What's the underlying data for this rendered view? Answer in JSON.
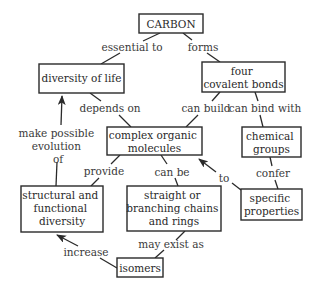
{
  "diagram": {
    "type": "concept-map",
    "colors": {
      "line": "#2a2a2a",
      "text": "#2a2a2a",
      "background": "#ffffff"
    },
    "nodes": {
      "carbon": {
        "lines": [
          "CARBON"
        ]
      },
      "diversity_of_life": {
        "lines": [
          "diversity of life"
        ]
      },
      "four_covalent_bonds": {
        "lines": [
          "four",
          "covalent bonds"
        ]
      },
      "complex_organic_molecules": {
        "lines": [
          "complex organic",
          "molecules"
        ]
      },
      "chemical_groups": {
        "lines": [
          "chemical",
          "groups"
        ]
      },
      "structural_functional_diversity": {
        "lines": [
          "structural and",
          "functional",
          "diversity"
        ]
      },
      "straight_branching_rings": {
        "lines": [
          "straight or",
          "branching chains",
          "and rings"
        ]
      },
      "specific_properties": {
        "lines": [
          "specific",
          "properties"
        ]
      },
      "isomers": {
        "lines": [
          "isomers"
        ]
      }
    },
    "edges": {
      "essential_to": {
        "from": "carbon",
        "to": "diversity_of_life",
        "lines": [
          "essential to"
        ]
      },
      "forms": {
        "from": "carbon",
        "to": "four_covalent_bonds",
        "lines": [
          "forms"
        ]
      },
      "depends_on": {
        "from": "diversity_of_life",
        "to": "complex_organic_molecules",
        "lines": [
          "depends on"
        ]
      },
      "can_build": {
        "from": "four_covalent_bonds",
        "to": "complex_organic_molecules",
        "lines": [
          "can build"
        ]
      },
      "can_bind_with": {
        "from": "four_covalent_bonds",
        "to": "chemical_groups",
        "lines": [
          "can bind with"
        ]
      },
      "make_possible": {
        "from": "structural_functional_diversity",
        "to": "diversity_of_life",
        "lines": [
          "make possible",
          "evolution",
          "of"
        ],
        "arrow": true
      },
      "provide": {
        "from": "complex_organic_molecules",
        "to": "structural_functional_diversity",
        "lines": [
          "provide"
        ]
      },
      "can_be": {
        "from": "complex_organic_molecules",
        "to": "straight_branching_rings",
        "lines": [
          "can be"
        ]
      },
      "confer": {
        "from": "chemical_groups",
        "to": "specific_properties",
        "lines": [
          "confer"
        ]
      },
      "to": {
        "from": "specific_properties",
        "to": "complex_organic_molecules",
        "lines": [
          "to"
        ],
        "arrow": true
      },
      "may_exist_as": {
        "from": "straight_branching_rings",
        "to": "isomers",
        "lines": [
          "may exist as"
        ]
      },
      "increase": {
        "from": "isomers",
        "to": "structural_functional_diversity",
        "lines": [
          "increase"
        ],
        "arrow": true
      }
    }
  }
}
